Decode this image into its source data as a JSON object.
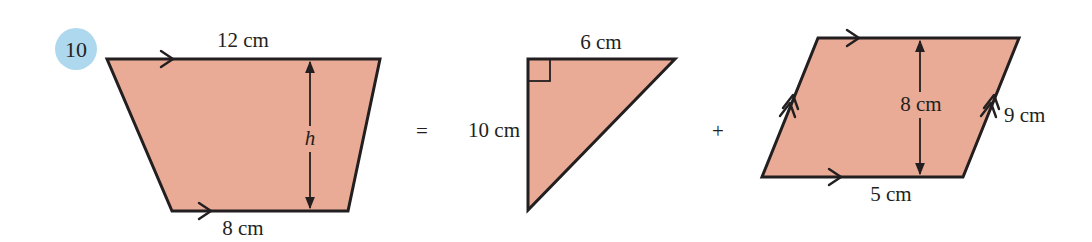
{
  "question": {
    "number": "10",
    "badge_color": "#aed8ee"
  },
  "colors": {
    "shape_fill": "#e9ab96",
    "stroke": "#231f20"
  },
  "operators": {
    "equals": "=",
    "plus": "+"
  },
  "trapezium": {
    "top_label": "12 cm",
    "bottom_label": "8 cm",
    "height_label": "h"
  },
  "triangle": {
    "top_label": "6 cm",
    "side_label": "10 cm"
  },
  "parallelogram": {
    "height_label": "8 cm",
    "side_label": "9 cm",
    "bottom_label": "5 cm"
  }
}
